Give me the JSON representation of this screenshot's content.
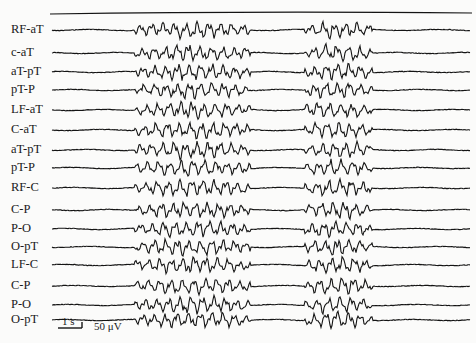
{
  "figure": {
    "type": "EEG recording",
    "trace_color": "#141414",
    "background_color": "#fbfbfa",
    "top_reference_trace": true,
    "channels": [
      {
        "label": "RF-aT",
        "y": 30
      },
      {
        "label": "c-aT",
        "y": 53
      },
      {
        "label": "aT-pT",
        "y": 72
      },
      {
        "label": "pT-P",
        "y": 90
      },
      {
        "label": "LF-aT",
        "y": 110
      },
      {
        "label": "C-aT",
        "y": 130
      },
      {
        "label": "aT-pT",
        "y": 150
      },
      {
        "label": "pT-P",
        "y": 168
      },
      {
        "label": "RF-C",
        "y": 188
      },
      {
        "label": "C-P",
        "y": 210
      },
      {
        "label": "P-O",
        "y": 229
      },
      {
        "label": "O-pT",
        "y": 247
      },
      {
        "label": "LF-C",
        "y": 265
      },
      {
        "label": "C-P",
        "y": 286
      },
      {
        "label": "P-O",
        "y": 305
      },
      {
        "label": "O-pT",
        "y": 320
      }
    ],
    "bursts": [
      {
        "start_x": 135,
        "end_x": 250
      },
      {
        "start_x": 305,
        "end_x": 372
      }
    ],
    "scale_bar": {
      "time_label": "1 s",
      "amplitude_label": "50 μV"
    }
  }
}
